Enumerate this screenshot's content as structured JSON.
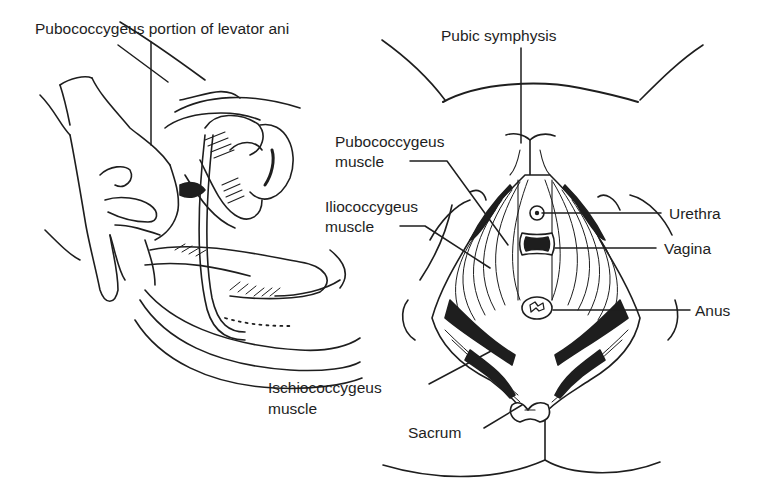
{
  "figure": {
    "left_panel": {
      "name": "sagittal view with gloved hand",
      "labels": {
        "pubococcygeus_portion": "Pubococcygeus portion of levator ani"
      }
    },
    "right_panel": {
      "name": "pelvic floor inferior view",
      "labels": {
        "pubic_symphysis": "Pubic symphysis",
        "pubococcygeus_line1": "Pubococcygeus",
        "pubococcygeus_line2": "muscle",
        "iliococcygeus_line1": "Iliococcygeus",
        "iliococcygeus_line2": "muscle",
        "ischiococcygeus_line1": "Ischiococcygeus",
        "ischiococcygeus_line2": "muscle",
        "urethra": "Urethra",
        "vagina": "Vagina",
        "anus": "Anus",
        "sacrum": "Sacrum"
      }
    }
  },
  "colors": {
    "ink": "#1e1e1e",
    "background": "#ffffff"
  }
}
